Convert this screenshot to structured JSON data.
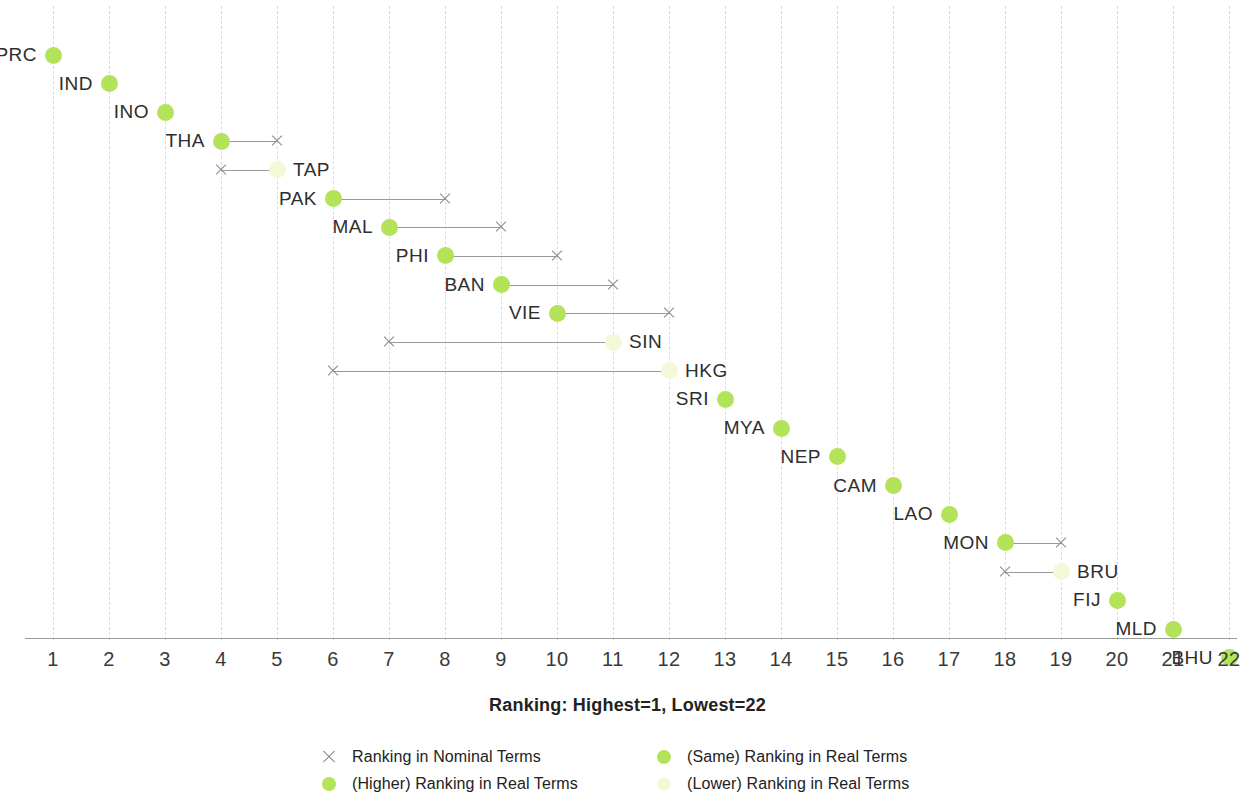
{
  "chart_data": {
    "type": "scatter",
    "title": "",
    "xlabel": "Ranking: Highest=1, Lowest=22",
    "ylabel": "",
    "xlim": [
      1,
      22
    ],
    "grid": true,
    "legend_position": "bottom",
    "x_ticks": [
      1,
      2,
      3,
      4,
      5,
      6,
      7,
      8,
      9,
      10,
      11,
      12,
      13,
      14,
      15,
      16,
      17,
      18,
      19,
      20,
      21,
      22
    ],
    "series": [
      {
        "name": "Ranking in Nominal Terms",
        "marker": "x",
        "color": "#8a8a8a"
      },
      {
        "name": "(Higher) Ranking in Real Terms",
        "marker": "dot",
        "color": "#b2e359"
      },
      {
        "name": "(Same) Ranking in Real Terms",
        "marker": "dot",
        "color": "#b2e359"
      },
      {
        "name": "(Lower) Ranking in Real Terms",
        "marker": "dot",
        "color": "#f4f8d8"
      }
    ],
    "rows": [
      {
        "economy": "PRC",
        "real": 1,
        "nominal": 1,
        "status": "same",
        "label_side": "left"
      },
      {
        "economy": "IND",
        "real": 2,
        "nominal": 2,
        "status": "same",
        "label_side": "left"
      },
      {
        "economy": "INO",
        "real": 3,
        "nominal": 3,
        "status": "same",
        "label_side": "left"
      },
      {
        "economy": "THA",
        "real": 4,
        "nominal": 5,
        "status": "higher",
        "label_side": "left"
      },
      {
        "economy": "TAP",
        "real": 5,
        "nominal": 4,
        "status": "lower",
        "label_side": "right"
      },
      {
        "economy": "PAK",
        "real": 6,
        "nominal": 8,
        "status": "higher",
        "label_side": "left"
      },
      {
        "economy": "MAL",
        "real": 7,
        "nominal": 9,
        "status": "higher",
        "label_side": "left"
      },
      {
        "economy": "PHI",
        "real": 8,
        "nominal": 10,
        "status": "higher",
        "label_side": "left"
      },
      {
        "economy": "BAN",
        "real": 9,
        "nominal": 11,
        "status": "higher",
        "label_side": "left"
      },
      {
        "economy": "VIE",
        "real": 10,
        "nominal": 12,
        "status": "higher",
        "label_side": "left"
      },
      {
        "economy": "SIN",
        "real": 11,
        "nominal": 7,
        "status": "lower",
        "label_side": "right"
      },
      {
        "economy": "HKG",
        "real": 12,
        "nominal": 6,
        "status": "lower",
        "label_side": "right"
      },
      {
        "economy": "SRI",
        "real": 13,
        "nominal": 13,
        "status": "same",
        "label_side": "left"
      },
      {
        "economy": "MYA",
        "real": 14,
        "nominal": 14,
        "status": "same",
        "label_side": "left"
      },
      {
        "economy": "NEP",
        "real": 15,
        "nominal": 15,
        "status": "same",
        "label_side": "left"
      },
      {
        "economy": "CAM",
        "real": 16,
        "nominal": 16,
        "status": "same",
        "label_side": "left"
      },
      {
        "economy": "LAO",
        "real": 17,
        "nominal": 17,
        "status": "same",
        "label_side": "left"
      },
      {
        "economy": "MON",
        "real": 18,
        "nominal": 19,
        "status": "higher",
        "label_side": "left"
      },
      {
        "economy": "BRU",
        "real": 19,
        "nominal": 18,
        "status": "lower",
        "label_side": "right"
      },
      {
        "economy": "FIJ",
        "real": 20,
        "nominal": 20,
        "status": "same",
        "label_side": "left"
      },
      {
        "economy": "MLD",
        "real": 21,
        "nominal": 21,
        "status": "same",
        "label_side": "left"
      },
      {
        "economy": "BHU",
        "real": 22,
        "nominal": 22,
        "status": "same",
        "label_side": "left"
      }
    ],
    "legend": [
      {
        "label": "Ranking in Nominal Terms",
        "marker": "cross",
        "color": "#8a8a8a"
      },
      {
        "label": "(Higher) Ranking in Real Terms",
        "marker": "dot",
        "color": "#b2e359"
      },
      {
        "label": "(Same) Ranking in Real Terms",
        "marker": "dot",
        "color": "#b2e359"
      },
      {
        "label": "(Lower) Ranking in Real Terms",
        "marker": "dot",
        "color": "#f4f8d8"
      }
    ]
  }
}
